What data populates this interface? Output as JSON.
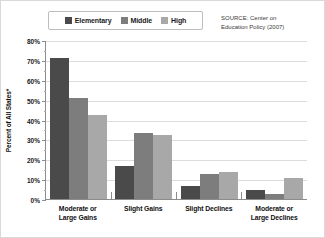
{
  "legend": {
    "entries": [
      {
        "label": "Elementary",
        "color": "#4a4a4a"
      },
      {
        "label": "Middle",
        "color": "#7d7d7d"
      },
      {
        "label": "High",
        "color": "#a8a8a8"
      }
    ]
  },
  "source": {
    "line1": "SOURCE: Center on",
    "line2": "Education Policy (2007)",
    "text": "SOURCE: Center on Education Policy (2007)"
  },
  "axes": {
    "y_title": "Percent of All States*",
    "y_ticks": [
      "0%",
      "10%",
      "20%",
      "30%",
      "40%",
      "50%",
      "60%",
      "70%",
      "80%"
    ]
  },
  "x_labels": [
    {
      "line1": "Moderate or",
      "line2": "Large Gains"
    },
    {
      "line1": "Slight Gains",
      "line2": ""
    },
    {
      "line1": "Slight Declines",
      "line2": ""
    },
    {
      "line1": "Moderate or",
      "line2": "Large Declines"
    }
  ],
  "chart_data": {
    "type": "bar",
    "title": "",
    "subtitle": "",
    "xlabel": "",
    "ylabel": "Percent of All States*",
    "ylim": [
      0,
      80
    ],
    "ytick_step": 10,
    "grid": true,
    "legend_position": "top-center",
    "categories": [
      "Moderate or Large Gains",
      "Slight Gains",
      "Slight Declines",
      "Moderate or Large Declines"
    ],
    "series": [
      {
        "name": "Elementary",
        "color": "#4a4a4a",
        "values": [
          71,
          16.5,
          6.5,
          4.5
        ]
      },
      {
        "name": "Middle",
        "color": "#7d7d7d",
        "values": [
          51,
          33,
          12.5,
          2.5
        ]
      },
      {
        "name": "High",
        "color": "#a8a8a8",
        "values": [
          42.5,
          32,
          13.5,
          10.5
        ]
      }
    ],
    "annotations": [
      "SOURCE: Center on Education Policy (2007)"
    ]
  }
}
